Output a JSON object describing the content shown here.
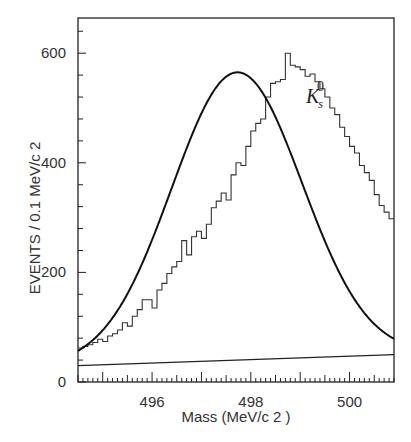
{
  "chart_data": {
    "type": "bar",
    "subtype": "histogram_with_fit",
    "title": "",
    "xlabel": "Mass (MeV/c 2 )",
    "ylabel": "EVENTS / 0.1 MeV/c 2",
    "xlim": [
      494.5,
      500.9
    ],
    "ylim": [
      0,
      660
    ],
    "xticks": [
      496,
      498,
      500
    ],
    "xtick_labels": [
      "496",
      "498",
      "500"
    ],
    "yticks": [
      0,
      200,
      400,
      600
    ],
    "ytick_labels": [
      "0",
      "200",
      "400",
      "600"
    ],
    "grid": false,
    "legend": null,
    "annotation": {
      "text": "K",
      "sub": "s",
      "sup": "0",
      "x": 499.6,
      "y": 520
    },
    "bin_width": 0.1,
    "bin_start": 494.5,
    "histogram_counts": [
      62,
      65,
      68,
      72,
      78,
      74,
      84,
      88,
      95,
      108,
      102,
      120,
      132,
      150,
      150,
      135,
      168,
      180,
      198,
      210,
      220,
      258,
      232,
      265,
      275,
      262,
      288,
      318,
      330,
      345,
      332,
      378,
      400,
      395,
      430,
      458,
      472,
      480,
      520,
      545,
      548,
      552,
      600,
      578,
      575,
      570,
      558,
      562,
      548,
      535,
      520,
      500,
      488,
      465,
      448,
      430,
      418,
      395,
      382,
      368,
      342,
      322,
      310,
      298,
      275,
      262,
      244,
      228,
      205,
      196,
      178,
      168,
      148,
      140,
      132,
      118,
      108,
      100,
      96,
      92,
      85,
      80,
      76,
      72,
      66,
      62,
      60,
      58,
      56,
      52,
      54,
      50,
      48,
      52
    ],
    "fit": {
      "model": "gaussian_plus_linear_background",
      "mean": 497.72,
      "sigma": 1.32,
      "amplitude": 525,
      "background": {
        "x": [
          494.5,
          500.9
        ],
        "y": [
          30,
          50
        ]
      }
    }
  }
}
